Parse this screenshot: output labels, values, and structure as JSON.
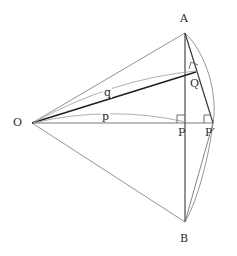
{
  "figure": {
    "background_color": "#ffffff",
    "stroke_color": "#3a3a3a",
    "thick_stroke_color": "#1f1f1f",
    "thin_stroke_color": "#6e6e6e",
    "label_color": "#2b2b2b"
  },
  "points": {
    "O": {
      "label": "O",
      "x": 32,
      "y": 123,
      "label_x": 13,
      "label_y": 117
    },
    "A": {
      "label": "A",
      "x": 185,
      "y": 33,
      "label_x": 180,
      "label_y": 13
    },
    "B": {
      "label": "B",
      "x": 185,
      "y": 222,
      "label_x": 180,
      "label_y": 233
    },
    "P": {
      "label": "P",
      "x": 185,
      "y": 123,
      "label_x": 177,
      "label_y": 127
    },
    "Pprime": {
      "label": "P′",
      "x": 212,
      "y": 123,
      "label_x": 206,
      "label_y": 127
    },
    "Q": {
      "label": "Q",
      "x": 193,
      "y": 77,
      "label_x": 190,
      "label_y": 78
    }
  },
  "arc_labels": {
    "p": {
      "label": "p",
      "x": 103,
      "y": 111
    },
    "q": {
      "label": "q",
      "x": 105,
      "y": 87
    }
  },
  "segments": [
    {
      "name": "O-A",
      "from": "O",
      "to": "A",
      "weight": "thin"
    },
    {
      "name": "O-B",
      "from": "O",
      "to": "B",
      "weight": "thin"
    },
    {
      "name": "O-P-prime",
      "from": "O",
      "to": "Pprime",
      "weight": "thin"
    },
    {
      "name": "O-Q",
      "from": "O",
      "to": "Q",
      "weight": "thick"
    },
    {
      "name": "A-B-vertical-chord",
      "from": "A",
      "to": "B",
      "weight": "medium"
    },
    {
      "name": "A-P-prime",
      "from": "A",
      "to": "Pprime",
      "weight": "medium"
    },
    {
      "name": "P-prime-B",
      "from": "Pprime",
      "to": "B",
      "weight": "thin"
    }
  ],
  "arcs": [
    {
      "name": "arc-A-P-prime-B",
      "description": "circular arc through A, P-prime and B bulging right"
    },
    {
      "name": "arc-p-O-to-P",
      "description": "shallow arc from O to P labelled p"
    },
    {
      "name": "arc-q-O-to-Q",
      "description": "shallow arc from O to Q labelled q"
    }
  ],
  "right_angles": [
    {
      "name": "right-angle-at-P",
      "at": "P",
      "description": "between OP-prime and AB"
    },
    {
      "name": "right-angle-at-P-prime",
      "at": "Pprime",
      "description": "between OP-prime and AP-prime"
    },
    {
      "name": "right-angle-at-Q",
      "at": "Q",
      "description": "between OQ and AP-prime"
    }
  ]
}
